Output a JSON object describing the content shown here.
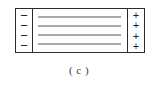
{
  "figure": {
    "caption": "( c )",
    "label_letter": "c",
    "colors": {
      "border": "#2b2b2b",
      "field_line": "#a9a9a9",
      "background": "#ffffff",
      "text": "#3a3a3a"
    },
    "negative_side": {
      "name": "negative-charge-column",
      "sign": "−",
      "count": 4,
      "signs": [
        "−",
        "−",
        "−",
        "−"
      ]
    },
    "positive_side": {
      "name": "positive-charge-column",
      "sign": "+",
      "count": 4,
      "signs": [
        "+",
        "+",
        "+",
        "+"
      ]
    },
    "field_lines": {
      "count": 4,
      "items": [
        "",
        "",
        "",
        ""
      ]
    }
  }
}
